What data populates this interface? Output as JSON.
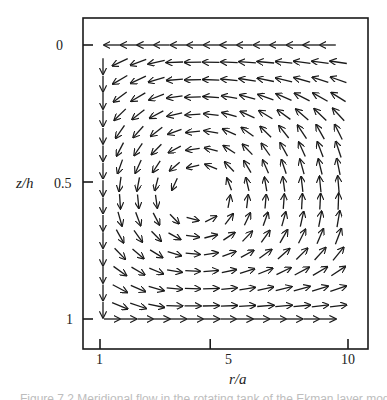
{
  "figure": {
    "caption_fragment": "Figure 7.2  Meridional flow in the rotating tank of the Ekman layer model",
    "frame": {
      "left": 83,
      "top": 18,
      "right": 368,
      "bottom": 349,
      "stroke": "#1a1a1a"
    }
  },
  "chart_data": {
    "type": "quiver",
    "title": "",
    "xlabel": "r/a",
    "ylabel": "z/h",
    "x_ticks": [
      {
        "value": 1,
        "label": "1"
      },
      {
        "value": 5,
        "label": "5"
      },
      {
        "value": 10,
        "label": "10"
      }
    ],
    "y_ticks": [
      {
        "value": 0,
        "label": "0"
      },
      {
        "value": 0.5,
        "label": "0.5"
      },
      {
        "value": 1,
        "label": "1"
      }
    ],
    "xlim": [
      0.9,
      10.5
    ],
    "ylim": [
      1.1,
      -0.1
    ],
    "y_inverted": true,
    "grid": false,
    "legend": null,
    "grid_rows_z": [
      0.0,
      0.063,
      0.127,
      0.19,
      0.254,
      0.317,
      0.381,
      0.444,
      0.508,
      0.571,
      0.635,
      0.698,
      0.762,
      0.825,
      0.889,
      0.952,
      1.0
    ],
    "vortex_center": {
      "r": 4.6,
      "z": 0.55
    },
    "top_row": {
      "z": 0,
      "direction": "toward r/a=1 (leftward)",
      "count": 14
    },
    "bottom_row": {
      "z": 1,
      "direction": "toward r/a=10 (rightward)",
      "count": 14
    },
    "inner_column": {
      "r": 1.05,
      "direction": "downward",
      "count": 18
    }
  }
}
